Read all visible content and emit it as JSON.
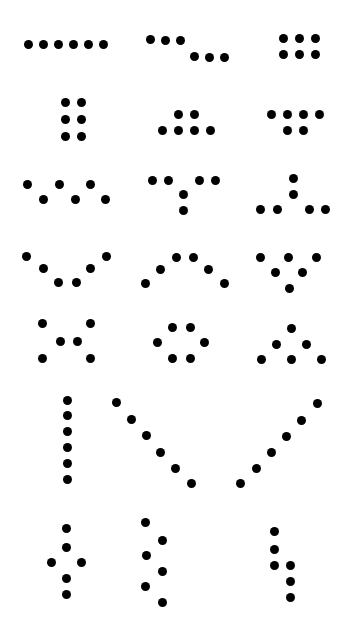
{
  "canvas": {
    "width": 355,
    "height": 638,
    "background_color": "#ffffff",
    "dot_color": "#000000",
    "dot_diameter": 9,
    "title": "Dot Pattern Sheet",
    "description": "Grid of 21 abstract dot-cluster patterns arranged in 7 rows by 3 columns on a plain white field.",
    "columns": 3,
    "rows": 7,
    "total_patterns": 21,
    "total_dots": 126
  },
  "patterns": [
    {
      "id": "r1c1",
      "row": 1,
      "column": 1,
      "name": "horizontal-line-six",
      "shape_label": "Horizontal row of six dots",
      "dot_count": 6,
      "dots": [
        {
          "x": 28,
          "y": 44
        },
        {
          "x": 43,
          "y": 44
        },
        {
          "x": 58,
          "y": 44
        },
        {
          "x": 73,
          "y": 44
        },
        {
          "x": 88,
          "y": 44
        },
        {
          "x": 103,
          "y": 44
        }
      ]
    },
    {
      "id": "r1c2",
      "row": 1,
      "column": 2,
      "name": "offset-stepped-rows",
      "shape_label": "Two offset rows of three, stepping down to the right",
      "dot_count": 6,
      "dots": [
        {
          "x": 150,
          "y": 39
        },
        {
          "x": 165,
          "y": 40
        },
        {
          "x": 180,
          "y": 40
        },
        {
          "x": 194,
          "y": 56
        },
        {
          "x": 209,
          "y": 57
        },
        {
          "x": 224,
          "y": 57
        }
      ]
    },
    {
      "id": "r1c3",
      "row": 1,
      "column": 3,
      "name": "grid-three-by-two",
      "shape_label": "Rectangular grid, three columns by two rows",
      "dot_count": 6,
      "dots": [
        {
          "x": 283,
          "y": 38
        },
        {
          "x": 299,
          "y": 38
        },
        {
          "x": 315,
          "y": 38
        },
        {
          "x": 283,
          "y": 54
        },
        {
          "x": 299,
          "y": 54
        },
        {
          "x": 315,
          "y": 54
        }
      ]
    },
    {
      "id": "r2c1",
      "row": 2,
      "column": 1,
      "name": "grid-two-by-three",
      "shape_label": "Rectangular grid, two columns by three rows",
      "dot_count": 6,
      "dots": [
        {
          "x": 65,
          "y": 102
        },
        {
          "x": 81,
          "y": 102
        },
        {
          "x": 65,
          "y": 119
        },
        {
          "x": 81,
          "y": 119
        },
        {
          "x": 65,
          "y": 136
        },
        {
          "x": 81,
          "y": 136
        }
      ]
    },
    {
      "id": "r2c2",
      "row": 2,
      "column": 2,
      "name": "pedestal-two-over-four",
      "shape_label": "Two dots centered above a base row of four",
      "dot_count": 6,
      "dots": [
        {
          "x": 178,
          "y": 114
        },
        {
          "x": 194,
          "y": 114
        },
        {
          "x": 162,
          "y": 130
        },
        {
          "x": 178,
          "y": 130
        },
        {
          "x": 194,
          "y": 130
        },
        {
          "x": 210,
          "y": 130
        }
      ]
    },
    {
      "id": "r2c3",
      "row": 2,
      "column": 3,
      "name": "canopy-four-over-two",
      "shape_label": "Row of four above two centered dots",
      "dot_count": 6,
      "dots": [
        {
          "x": 271,
          "y": 114
        },
        {
          "x": 287,
          "y": 114
        },
        {
          "x": 303,
          "y": 114
        },
        {
          "x": 319,
          "y": 114
        },
        {
          "x": 287,
          "y": 130
        },
        {
          "x": 303,
          "y": 130
        }
      ]
    },
    {
      "id": "r3c1",
      "row": 3,
      "column": 1,
      "name": "zigzag-six",
      "shape_label": "Alternating zigzag of six dots in two staggered rows",
      "dot_count": 6,
      "dots": [
        {
          "x": 27,
          "y": 184
        },
        {
          "x": 59,
          "y": 184
        },
        {
          "x": 90,
          "y": 184
        },
        {
          "x": 43,
          "y": 199
        },
        {
          "x": 75,
          "y": 199
        },
        {
          "x": 105,
          "y": 199
        }
      ]
    },
    {
      "id": "r3c2",
      "row": 3,
      "column": 2,
      "name": "tee-down-pairs",
      "shape_label": "Two pairs of dots on top with two dots descending from the centre",
      "dot_count": 6,
      "dots": [
        {
          "x": 152,
          "y": 180
        },
        {
          "x": 168,
          "y": 180
        },
        {
          "x": 199,
          "y": 180
        },
        {
          "x": 215,
          "y": 180
        },
        {
          "x": 183,
          "y": 194
        },
        {
          "x": 183,
          "y": 210
        }
      ]
    },
    {
      "id": "r3c3",
      "row": 3,
      "column": 3,
      "name": "tee-up-pairs",
      "shape_label": "Two dots rising from the centre of a split base row of four",
      "dot_count": 6,
      "dots": [
        {
          "x": 293,
          "y": 178
        },
        {
          "x": 293,
          "y": 194
        },
        {
          "x": 260,
          "y": 209
        },
        {
          "x": 277,
          "y": 209
        },
        {
          "x": 309,
          "y": 209
        },
        {
          "x": 325,
          "y": 209
        }
      ]
    },
    {
      "id": "r4c1",
      "row": 4,
      "column": 1,
      "name": "vee-valley",
      "shape_label": "V shape, six dots dipping to a low centre",
      "dot_count": 6,
      "dots": [
        {
          "x": 26,
          "y": 256
        },
        {
          "x": 43,
          "y": 268
        },
        {
          "x": 58,
          "y": 282
        },
        {
          "x": 76,
          "y": 282
        },
        {
          "x": 90,
          "y": 268
        },
        {
          "x": 106,
          "y": 256
        }
      ]
    },
    {
      "id": "r4c2",
      "row": 4,
      "column": 2,
      "name": "arch-peak",
      "shape_label": "Inverted V arch, six dots rising to a high centre",
      "dot_count": 6,
      "dots": [
        {
          "x": 145,
          "y": 283
        },
        {
          "x": 160,
          "y": 269
        },
        {
          "x": 176,
          "y": 257
        },
        {
          "x": 193,
          "y": 257
        },
        {
          "x": 208,
          "y": 269
        },
        {
          "x": 224,
          "y": 283
        }
      ]
    },
    {
      "id": "r4c3",
      "row": 4,
      "column": 3,
      "name": "triangle-down",
      "shape_label": "Downward triangle, three over two over one",
      "dot_count": 6,
      "dots": [
        {
          "x": 260,
          "y": 257
        },
        {
          "x": 288,
          "y": 257
        },
        {
          "x": 316,
          "y": 257
        },
        {
          "x": 275,
          "y": 272
        },
        {
          "x": 302,
          "y": 272
        },
        {
          "x": 289,
          "y": 288
        }
      ]
    },
    {
      "id": "r5c1",
      "row": 5,
      "column": 1,
      "name": "hourglass-x",
      "shape_label": "Hourglass X, pairs at top, centre and bottom",
      "dot_count": 6,
      "dots": [
        {
          "x": 42,
          "y": 323
        },
        {
          "x": 90,
          "y": 323
        },
        {
          "x": 60,
          "y": 341
        },
        {
          "x": 77,
          "y": 341
        },
        {
          "x": 42,
          "y": 358
        },
        {
          "x": 90,
          "y": 358
        }
      ]
    },
    {
      "id": "r5c2",
      "row": 5,
      "column": 2,
      "name": "hexagon-ring",
      "shape_label": "Hexagonal ring of six dots around an empty centre",
      "dot_count": 6,
      "dots": [
        {
          "x": 172,
          "y": 327
        },
        {
          "x": 190,
          "y": 327
        },
        {
          "x": 157,
          "y": 342
        },
        {
          "x": 204,
          "y": 342
        },
        {
          "x": 172,
          "y": 358
        },
        {
          "x": 190,
          "y": 358
        }
      ]
    },
    {
      "id": "r5c3",
      "row": 5,
      "column": 3,
      "name": "triangle-up",
      "shape_label": "Upward triangle, one over two over three",
      "dot_count": 6,
      "dots": [
        {
          "x": 291,
          "y": 328
        },
        {
          "x": 276,
          "y": 344
        },
        {
          "x": 306,
          "y": 344
        },
        {
          "x": 261,
          "y": 359
        },
        {
          "x": 291,
          "y": 359
        },
        {
          "x": 321,
          "y": 359
        }
      ]
    },
    {
      "id": "r6c1",
      "row": 6,
      "column": 1,
      "name": "vertical-line-six",
      "shape_label": "Vertical column of six dots",
      "dot_count": 6,
      "dots": [
        {
          "x": 67,
          "y": 400
        },
        {
          "x": 67,
          "y": 415
        },
        {
          "x": 67,
          "y": 431
        },
        {
          "x": 67,
          "y": 447
        },
        {
          "x": 67,
          "y": 463
        },
        {
          "x": 67,
          "y": 479
        }
      ]
    },
    {
      "id": "r6c2",
      "row": 6,
      "column": 2,
      "name": "diagonal-descending-six",
      "shape_label": "Descending diagonal line of six dots",
      "dot_count": 6,
      "dots": [
        {
          "x": 116,
          "y": 402
        },
        {
          "x": 131,
          "y": 419
        },
        {
          "x": 146,
          "y": 435
        },
        {
          "x": 160,
          "y": 452
        },
        {
          "x": 175,
          "y": 468
        },
        {
          "x": 191,
          "y": 483
        }
      ]
    },
    {
      "id": "r6c3",
      "row": 6,
      "column": 3,
      "name": "diagonal-ascending-six",
      "shape_label": "Ascending diagonal line of six dots",
      "dot_count": 6,
      "dots": [
        {
          "x": 240,
          "y": 483
        },
        {
          "x": 256,
          "y": 468
        },
        {
          "x": 271,
          "y": 452
        },
        {
          "x": 286,
          "y": 436
        },
        {
          "x": 301,
          "y": 420
        },
        {
          "x": 317,
          "y": 403
        }
      ]
    },
    {
      "id": "r7c1",
      "row": 7,
      "column": 1,
      "name": "cross-vertical-four",
      "shape_label": "Vertical column of four with a flanking dot on each side",
      "dot_count": 6,
      "dots": [
        {
          "x": 66,
          "y": 528
        },
        {
          "x": 66,
          "y": 547
        },
        {
          "x": 51,
          "y": 562
        },
        {
          "x": 81,
          "y": 562
        },
        {
          "x": 66,
          "y": 578
        },
        {
          "x": 66,
          "y": 594
        }
      ]
    },
    {
      "id": "r7c2",
      "row": 7,
      "column": 2,
      "name": "double-column-stagger",
      "shape_label": "Two staggered vertical columns of three dots each",
      "dot_count": 6,
      "dots": [
        {
          "x": 145,
          "y": 522
        },
        {
          "x": 162,
          "y": 540
        },
        {
          "x": 146,
          "y": 555
        },
        {
          "x": 162,
          "y": 571
        },
        {
          "x": 145,
          "y": 586
        },
        {
          "x": 162,
          "y": 602
        }
      ]
    },
    {
      "id": "r7c3",
      "row": 7,
      "column": 3,
      "name": "column-split-branch",
      "shape_label": "Vertical column of three branching into a lower offset column of three",
      "dot_count": 6,
      "dots": [
        {
          "x": 274,
          "y": 531
        },
        {
          "x": 274,
          "y": 549
        },
        {
          "x": 274,
          "y": 565
        },
        {
          "x": 290,
          "y": 565
        },
        {
          "x": 290,
          "y": 581
        },
        {
          "x": 290,
          "y": 597
        }
      ]
    }
  ]
}
